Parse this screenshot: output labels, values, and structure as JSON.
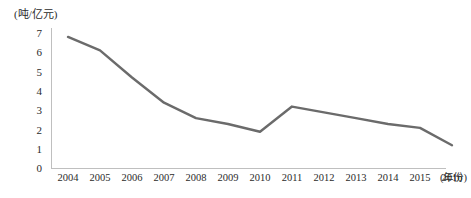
{
  "chart_data": {
    "type": "line",
    "title": "",
    "subtitle": "",
    "unit_label": "(吨/亿元)",
    "xlabel": "(年份)",
    "ylabel": "",
    "categories": [
      "2004",
      "2005",
      "2006",
      "2007",
      "2008",
      "2009",
      "2010",
      "2011",
      "2012",
      "2013",
      "2014",
      "2015",
      "2016"
    ],
    "values": [
      6.8,
      6.1,
      4.7,
      3.4,
      2.6,
      2.3,
      1.9,
      3.2,
      2.9,
      2.6,
      2.3,
      2.1,
      1.2
    ],
    "series": [
      {
        "name": "",
        "values": [
          6.8,
          6.1,
          4.7,
          3.4,
          2.6,
          2.3,
          1.9,
          3.2,
          2.9,
          2.6,
          2.3,
          2.1,
          1.2
        ],
        "color": "#6b6b6b"
      }
    ],
    "yticks": [
      "0",
      "1",
      "2",
      "3",
      "4",
      "5",
      "6",
      "7"
    ],
    "ylim": [
      0,
      7
    ],
    "grid": false,
    "legend": false,
    "legend_position": "none",
    "axis_color": "#bfbfbf",
    "line_color": "#6b6b6b",
    "line_width": 2.4,
    "markers": false
  }
}
